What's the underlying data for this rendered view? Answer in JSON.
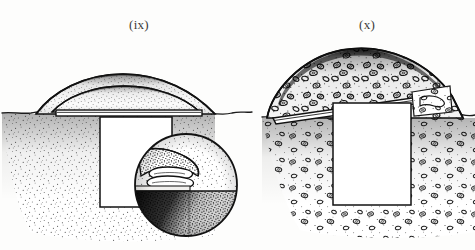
{
  "figure": {
    "background_color": "#fdfdfc",
    "ink_color": "#1a1a1a",
    "caption_color": "#3a3a38",
    "width": 475,
    "height": 250,
    "panels": [
      {
        "id": "panel-ix",
        "label": "(ix)",
        "label_x": 129,
        "label_y": 17,
        "description": "Cross-section of an earthen mound over a rectangular sub-surface chamber, with a horizontal capping slab at ground level and a circular inset magnification",
        "mound": {
          "type": "two-layer earthen dome",
          "fill": "fine stipple",
          "layers": 2,
          "apex_x": 123,
          "apex_y": 74,
          "base_left_x": 36,
          "base_right_x": 215,
          "ground_y": 114
        },
        "capping_slab": {
          "orientation": "horizontal",
          "left_x": 56,
          "right_x": 202,
          "top_y": 110,
          "thickness_px": 6,
          "fill": "white with dark outline"
        },
        "chamber": {
          "shape": "rectangle",
          "fill": "#ffffff",
          "left_x": 100,
          "right_x": 172,
          "top_y": 117,
          "bottom_y": 207
        },
        "matrix": {
          "type": "soil",
          "fill": "fine stipple",
          "inclusions": "none"
        },
        "inset": {
          "type": "circular magnification",
          "center_x": 186,
          "center_y": 185,
          "radius": 51,
          "contents": [
            "stippled soil wedge (upper left)",
            "stacked coiled rings (central)",
            "pale horizontal band (mid)",
            "dark-to-stipple graded deposit (lower)"
          ]
        }
      },
      {
        "id": "panel-x",
        "label": "(x)",
        "label_x": 359,
        "label_y": 17,
        "description": "Cross-section of a stone-loaded cairn mound over a rectangular sub-surface chamber, with a tilted capping slab shown in perspective and stone-filled surrounding matrix",
        "mound": {
          "type": "stone-loaded cairn dome",
          "fill": "dense stipple with outlined stone clasts",
          "layers": 1,
          "crest_dark_band": true,
          "apex_x": 355,
          "apex_y": 49,
          "base_left_x": 267,
          "base_right_x": 463,
          "ground_y": 118
        },
        "capping_slab": {
          "orientation": "tilted, rising to the right",
          "left_x": 273,
          "right_x": 443,
          "left_y": 118,
          "right_y": 96,
          "thickness_px": 7,
          "fill": "white with dark outline"
        },
        "chamber": {
          "shape": "rectangle",
          "fill": "#ffffff",
          "left_x": 333,
          "right_x": 411,
          "top_y": 103,
          "bottom_y": 205
        },
        "matrix": {
          "type": "stony soil",
          "fill": "stipple",
          "inclusions": "outlined rounded stones"
        },
        "inset": null
      }
    ]
  }
}
